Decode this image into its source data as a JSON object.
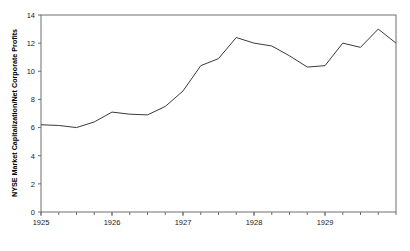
{
  "chart_data": {
    "type": "line",
    "title": "",
    "xlabel": "",
    "ylabel": "NYSE Market Capitalization/Net Corporate Profits",
    "xlim": [
      1925.0,
      1930.0
    ],
    "ylim": [
      0,
      14
    ],
    "grid": false,
    "legend": null,
    "y_ticks": [
      0,
      2,
      4,
      6,
      8,
      10,
      12,
      14
    ],
    "y_tick_labels": [
      "0",
      "2",
      "4",
      "6",
      "8",
      "10",
      "12",
      "14"
    ],
    "x_ticks": [
      1925,
      1926,
      1927,
      1928,
      1929
    ],
    "x_tick_labels": [
      "1925",
      "1926",
      "1927",
      "1928",
      "1929"
    ],
    "x_minor_tick_interval": 0.25,
    "series_name": "NYSE Market Capitalization/Net Corporate Profits",
    "line_color": "#3a3a3a",
    "frame_color": "#6e6e6e",
    "x": [
      1925.0,
      1925.25,
      1925.5,
      1925.75,
      1926.0,
      1926.25,
      1926.5,
      1926.75,
      1927.0,
      1927.25,
      1927.5,
      1927.75,
      1928.0,
      1928.25,
      1928.5,
      1928.75,
      1929.0,
      1929.25,
      1929.5,
      1929.75,
      1930.0
    ],
    "values": [
      6.2,
      6.15,
      6.0,
      6.4,
      7.1,
      6.95,
      6.9,
      7.5,
      8.6,
      10.4,
      10.9,
      12.4,
      12.0,
      11.8,
      11.1,
      10.3,
      10.4,
      12.0,
      11.7,
      13.0,
      12.0
    ]
  }
}
